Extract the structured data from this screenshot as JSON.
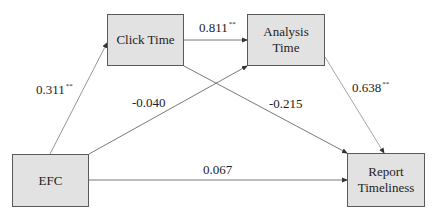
{
  "diagram": {
    "nodes": {
      "click_time": {
        "label": "Click Time"
      },
      "analysis_time": {
        "line1": "Analysis",
        "line2": "Time"
      },
      "efc": {
        "label": "EFC"
      },
      "report_timeliness": {
        "line1": "Report",
        "line2": "Timeliness"
      }
    },
    "edges": {
      "efc_to_click_time": {
        "value": "0.311",
        "sig": "**"
      },
      "click_time_to_analysis_time": {
        "value": "0.811",
        "sig": "**"
      },
      "efc_to_analysis_time": {
        "value": "-0.040",
        "sig": ""
      },
      "click_time_to_report_timeliness": {
        "value": "-0.215",
        "sig": ""
      },
      "analysis_time_to_report_timeliness": {
        "value": "0.638",
        "sig": "**"
      },
      "efc_to_report_timeliness": {
        "value": "0.067",
        "sig": ""
      }
    },
    "colors": {
      "node_fill": "#e2e2e2",
      "node_border": "#5a5a5a",
      "edge": "#6a6a6a"
    }
  }
}
